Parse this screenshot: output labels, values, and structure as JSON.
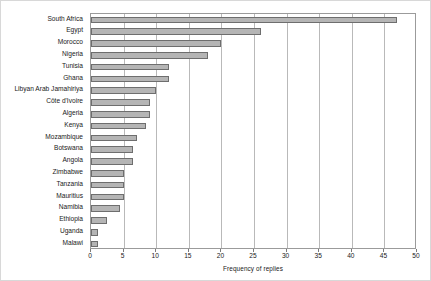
{
  "chart_data": {
    "type": "bar",
    "orientation": "horizontal",
    "title": "",
    "xlabel": "Frequency of replies",
    "ylabel": "",
    "xlim": [
      0,
      50
    ],
    "xticks": [
      0,
      5,
      10,
      15,
      20,
      25,
      30,
      35,
      40,
      45,
      50
    ],
    "grid": "vertical",
    "legend": "none",
    "bar_fill_color": "#b5b5b5",
    "bar_edge_color": "#6e6e6e",
    "categories": [
      "South Africa",
      "Egypt",
      "Morocco",
      "Nigeria",
      "Tunisia",
      "Ghana",
      "Libyan Arab Jamahiriya",
      "Côte d'Ivoire",
      "Algeria",
      "Kenya",
      "Mozambique",
      "Botswana",
      "Angola",
      "Zimbabwe",
      "Tanzania",
      "Mauritius",
      "Namibia",
      "Ethiopia",
      "Uganda",
      "Malawi"
    ],
    "values": [
      47,
      26,
      20,
      18,
      12,
      12,
      10,
      9,
      9,
      8.5,
      7,
      6.5,
      6.5,
      5,
      5,
      5,
      4.5,
      2.5,
      1,
      1
    ]
  }
}
